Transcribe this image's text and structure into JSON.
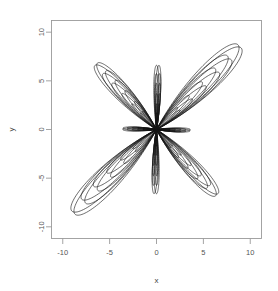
{
  "figure": {
    "title": "",
    "background_color": "#ffffff",
    "frame_color": "#9a9a9a",
    "curve_color": "#151515",
    "width": 278,
    "height": 291
  },
  "axes": {
    "x_title": "x",
    "y_title": "y",
    "x_ticks": [
      "-10",
      "-5",
      "0",
      "5",
      "10"
    ],
    "y_ticks": [
      "10",
      "5",
      "0",
      "-5",
      "-10"
    ]
  },
  "chart_data": {
    "type": "line",
    "title": "",
    "xlabel": "x",
    "ylabel": "y",
    "xlim": [
      -11.2,
      11.2
    ],
    "ylim": [
      -11.2,
      11.2
    ],
    "x_ticks": [
      -10,
      -5,
      0,
      5,
      10
    ],
    "y_ticks": [
      -10,
      -5,
      0,
      5,
      10
    ],
    "grid": false,
    "legend": "none",
    "series": [
      {
        "name": "rose-1",
        "scale": 1.0,
        "petals": [
          {
            "angle_deg": 45,
            "reach": 12.3,
            "halfwidth_deg": 17
          },
          {
            "angle_deg": 90,
            "reach": 6.6,
            "halfwidth_deg": 8
          },
          {
            "angle_deg": 135,
            "reach": 9.3,
            "halfwidth_deg": 15
          },
          {
            "angle_deg": 180,
            "reach": 3.6,
            "halfwidth_deg": 9
          },
          {
            "angle_deg": 225,
            "reach": 12.3,
            "halfwidth_deg": 17
          },
          {
            "angle_deg": 270,
            "reach": 6.6,
            "halfwidth_deg": 8
          },
          {
            "angle_deg": 315,
            "reach": 9.3,
            "halfwidth_deg": 15
          },
          {
            "angle_deg": 0,
            "reach": 3.6,
            "halfwidth_deg": 9
          }
        ]
      },
      {
        "name": "rose-2",
        "scale": 0.87,
        "petals": [
          {
            "angle_deg": 45,
            "reach": 12.3,
            "halfwidth_deg": 16
          },
          {
            "angle_deg": 90,
            "reach": 6.6,
            "halfwidth_deg": 7
          },
          {
            "angle_deg": 135,
            "reach": 9.3,
            "halfwidth_deg": 14
          },
          {
            "angle_deg": 180,
            "reach": 3.6,
            "halfwidth_deg": 8
          },
          {
            "angle_deg": 225,
            "reach": 12.3,
            "halfwidth_deg": 16
          },
          {
            "angle_deg": 270,
            "reach": 6.6,
            "halfwidth_deg": 7
          },
          {
            "angle_deg": 315,
            "reach": 9.3,
            "halfwidth_deg": 14
          },
          {
            "angle_deg": 0,
            "reach": 3.6,
            "halfwidth_deg": 8
          }
        ]
      },
      {
        "name": "rose-3",
        "scale": 0.72,
        "petals": [
          {
            "angle_deg": 45,
            "reach": 12.3,
            "halfwidth_deg": 15
          },
          {
            "angle_deg": 90,
            "reach": 6.6,
            "halfwidth_deg": 6
          },
          {
            "angle_deg": 135,
            "reach": 9.3,
            "halfwidth_deg": 13
          },
          {
            "angle_deg": 180,
            "reach": 3.6,
            "halfwidth_deg": 7
          },
          {
            "angle_deg": 225,
            "reach": 12.3,
            "halfwidth_deg": 15
          },
          {
            "angle_deg": 270,
            "reach": 6.6,
            "halfwidth_deg": 6
          },
          {
            "angle_deg": 315,
            "reach": 9.3,
            "halfwidth_deg": 13
          },
          {
            "angle_deg": 0,
            "reach": 3.6,
            "halfwidth_deg": 7
          }
        ]
      },
      {
        "name": "rose-4",
        "scale": 0.56,
        "petals": [
          {
            "angle_deg": 45,
            "reach": 12.3,
            "halfwidth_deg": 13
          },
          {
            "angle_deg": 90,
            "reach": 6.6,
            "halfwidth_deg": 6
          },
          {
            "angle_deg": 135,
            "reach": 9.3,
            "halfwidth_deg": 11
          },
          {
            "angle_deg": 180,
            "reach": 3.6,
            "halfwidth_deg": 6
          },
          {
            "angle_deg": 225,
            "reach": 12.3,
            "halfwidth_deg": 13
          },
          {
            "angle_deg": 270,
            "reach": 6.6,
            "halfwidth_deg": 6
          },
          {
            "angle_deg": 315,
            "reach": 9.3,
            "halfwidth_deg": 11
          },
          {
            "angle_deg": 0,
            "reach": 3.6,
            "halfwidth_deg": 6
          }
        ]
      },
      {
        "name": "rose-5",
        "scale": 0.4,
        "petals": [
          {
            "angle_deg": 45,
            "reach": 12.3,
            "halfwidth_deg": 11
          },
          {
            "angle_deg": 90,
            "reach": 6.6,
            "halfwidth_deg": 5
          },
          {
            "angle_deg": 135,
            "reach": 9.3,
            "halfwidth_deg": 9
          },
          {
            "angle_deg": 180,
            "reach": 3.6,
            "halfwidth_deg": 5
          },
          {
            "angle_deg": 225,
            "reach": 12.3,
            "halfwidth_deg": 11
          },
          {
            "angle_deg": 270,
            "reach": 6.6,
            "halfwidth_deg": 5
          },
          {
            "angle_deg": 315,
            "reach": 9.3,
            "halfwidth_deg": 9
          },
          {
            "angle_deg": 0,
            "reach": 3.6,
            "halfwidth_deg": 5
          }
        ]
      },
      {
        "name": "rose-6",
        "scale": 0.26,
        "petals": [
          {
            "angle_deg": 45,
            "reach": 12.3,
            "halfwidth_deg": 9
          },
          {
            "angle_deg": 90,
            "reach": 6.6,
            "halfwidth_deg": 5
          },
          {
            "angle_deg": 135,
            "reach": 9.3,
            "halfwidth_deg": 8
          },
          {
            "angle_deg": 180,
            "reach": 3.6,
            "halfwidth_deg": 5
          },
          {
            "angle_deg": 225,
            "reach": 12.3,
            "halfwidth_deg": 9
          },
          {
            "angle_deg": 270,
            "reach": 6.6,
            "halfwidth_deg": 5
          },
          {
            "angle_deg": 315,
            "reach": 9.3,
            "halfwidth_deg": 8
          },
          {
            "angle_deg": 0,
            "reach": 3.6,
            "halfwidth_deg": 5
          }
        ]
      }
    ]
  }
}
